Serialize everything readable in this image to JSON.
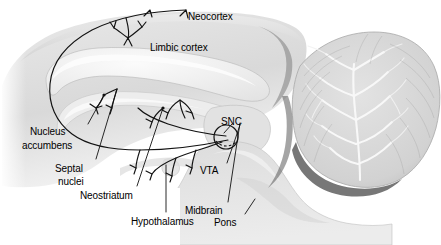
{
  "figure": {
    "kind": "anatomical-diagram",
    "background_color": "#ffffff",
    "ink_color": "#111111",
    "tissue_light": "#e4e4e4",
    "tissue_mid": "#c8c8c8",
    "tissue_dark": "#6e6e6e",
    "cerebellum_color": "#d5d5d5"
  },
  "labels": [
    {
      "id": "neocortex",
      "text": "Neocortex",
      "x": 188,
      "y": 11,
      "align": "left"
    },
    {
      "id": "limbic-cortex",
      "text": "Limbic cortex",
      "x": 150,
      "y": 42,
      "align": "left"
    },
    {
      "id": "snc",
      "text": "SNC",
      "x": 221,
      "y": 116,
      "align": "left"
    },
    {
      "id": "vta",
      "text": "VTA",
      "x": 200,
      "y": 165,
      "align": "left"
    },
    {
      "id": "nucleus-accumbens",
      "text": "Nucleus",
      "x": 30,
      "y": 126,
      "align": "left"
    },
    {
      "id": "nucleus-accumbens-2",
      "text": "accumbens",
      "x": 22,
      "y": 140,
      "align": "left"
    },
    {
      "id": "septal-nuclei",
      "text": "Septal",
      "x": 55,
      "y": 163,
      "align": "left"
    },
    {
      "id": "septal-nuclei-2",
      "text": "nuclei",
      "x": 58,
      "y": 176,
      "align": "left"
    },
    {
      "id": "neostriatum",
      "text": "Neostriatum",
      "x": 80,
      "y": 190,
      "align": "left"
    },
    {
      "id": "hypothalamus",
      "text": "Hypothalamus",
      "x": 131,
      "y": 216,
      "align": "left"
    },
    {
      "id": "midbrain",
      "text": "Midbrain",
      "x": 185,
      "y": 205,
      "align": "left"
    },
    {
      "id": "pons",
      "text": "Pons",
      "x": 214,
      "y": 217,
      "align": "left"
    }
  ],
  "leader_lines": [
    {
      "id": "leader-nucleus-accumbens",
      "from": [
        88,
        124
      ],
      "to": [
        104,
        95
      ]
    },
    {
      "id": "leader-septal-nuclei",
      "from": [
        96,
        159
      ],
      "to": [
        117,
        89
      ]
    },
    {
      "id": "leader-neostriatum",
      "from": [
        137,
        186
      ],
      "to": [
        163,
        108
      ]
    },
    {
      "id": "leader-hypothalamus",
      "from": [
        166,
        212
      ],
      "to": [
        166,
        165
      ]
    },
    {
      "id": "leader-midbrain",
      "from": [
        228,
        202
      ],
      "to": [
        240,
        123
      ]
    },
    {
      "id": "leader-pons",
      "from": [
        245,
        214
      ],
      "to": [
        255,
        199
      ]
    },
    {
      "id": "leader-vta",
      "from": [
        227,
        163
      ],
      "to": [
        240,
        125
      ]
    },
    {
      "id": "leader-snc",
      "from": [
        232,
        124
      ],
      "to": [
        224,
        133
      ]
    }
  ],
  "structures": [
    {
      "id": "cerebral-cortex",
      "name": "cerebral cortex"
    },
    {
      "id": "corpus-callosum",
      "name": "corpus callosum"
    },
    {
      "id": "fornix",
      "name": "fornix"
    },
    {
      "id": "thalamus",
      "name": "thalamus"
    },
    {
      "id": "brainstem",
      "name": "brainstem"
    },
    {
      "id": "pons-body",
      "name": "pons"
    },
    {
      "id": "cerebellum",
      "name": "cerebellum with arbor vitae"
    },
    {
      "id": "snc-vta-circle",
      "name": "SNC / VTA marker circle"
    }
  ],
  "pathways": [
    {
      "id": "mesocortical",
      "name": "mesocortical projection to neocortex and limbic cortex"
    },
    {
      "id": "mesolimbic",
      "name": "mesolimbic projection to nucleus accumbens and septal nuclei"
    },
    {
      "id": "nigrostriatal",
      "name": "nigrostriatal projection to neostriatum"
    },
    {
      "id": "tuberoinfundibular",
      "name": "projection toward hypothalamus"
    }
  ]
}
